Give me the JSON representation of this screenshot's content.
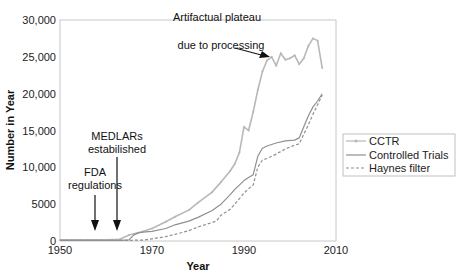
{
  "chart_data": {
    "type": "line",
    "title": "",
    "xlabel": "Year",
    "ylabel": "Number in Year",
    "xlim": [
      1950,
      2010
    ],
    "ylim": [
      0,
      30000
    ],
    "x_ticks": [
      1950,
      1970,
      1990,
      2010
    ],
    "x_tick_labels": [
      "1950",
      "1970",
      "1990",
      "2010"
    ],
    "y_ticks": [
      0,
      5000,
      10000,
      15000,
      20000,
      25000,
      30000
    ],
    "y_tick_labels": [
      "0",
      "5000",
      "10,000",
      "15,000",
      "20,000",
      "25,000",
      "30,000"
    ],
    "grid": false,
    "legend_position": "right",
    "series": [
      {
        "name": "CCTR",
        "style": "solid-marker",
        "color": "#b8b8b8",
        "x": [
          1950,
          1955,
          1960,
          1963,
          1965,
          1968,
          1970,
          1973,
          1975,
          1978,
          1980,
          1983,
          1985,
          1987,
          1988,
          1989,
          1990,
          1991,
          1992,
          1993,
          1994,
          1995,
          1996,
          1997,
          1998,
          1999,
          2000,
          2001,
          2002,
          2003,
          2004,
          2005,
          2006,
          2007
        ],
        "y": [
          150,
          150,
          150,
          250,
          800,
          1300,
          1700,
          2600,
          3300,
          4200,
          5200,
          6600,
          8000,
          9500,
          10500,
          12000,
          15500,
          15000,
          17500,
          20500,
          23000,
          24500,
          25000,
          23800,
          25500,
          24600,
          24800,
          25200,
          24000,
          24800,
          26500,
          27500,
          27200,
          23500
        ]
      },
      {
        "name": "Controlled Trials",
        "style": "solid",
        "color": "#909090",
        "x": [
          1950,
          1955,
          1960,
          1963,
          1965,
          1966,
          1967,
          1968,
          1970,
          1973,
          1975,
          1978,
          1980,
          1983,
          1985,
          1987,
          1988,
          1990,
          1991,
          1992,
          1993,
          1994,
          1995,
          1997,
          1999,
          2001,
          2002,
          2003,
          2004,
          2005,
          2006,
          2007
        ],
        "y": [
          100,
          100,
          100,
          100,
          150,
          800,
          1100,
          1200,
          1300,
          1700,
          2200,
          2700,
          3200,
          4100,
          5000,
          6300,
          7000,
          8200,
          8600,
          9000,
          11500,
          12600,
          12900,
          13300,
          13600,
          13700,
          14000,
          15500,
          17000,
          18200,
          19000,
          20000
        ]
      },
      {
        "name": "Haynes filter",
        "style": "dashed",
        "color": "#909090",
        "x": [
          1950,
          1955,
          1960,
          1965,
          1968,
          1970,
          1973,
          1975,
          1978,
          1980,
          1983,
          1984,
          1985,
          1987,
          1988,
          1990,
          1991,
          1992,
          1993,
          1994,
          1995,
          1997,
          1999,
          2001,
          2002,
          2003,
          2004,
          2005,
          2006,
          2007
        ],
        "y": [
          100,
          100,
          100,
          100,
          120,
          300,
          600,
          900,
          1400,
          1900,
          2500,
          2700,
          3500,
          4300,
          5000,
          6500,
          7100,
          7600,
          10000,
          11000,
          11200,
          11800,
          12500,
          13000,
          13200,
          14500,
          15800,
          17200,
          18500,
          19800
        ]
      }
    ],
    "annotations": [
      {
        "id": "plateau",
        "lines": [
          "Artifactual plateau",
          "due to processing"
        ],
        "target_x": 1996,
        "target_y": 24500
      },
      {
        "id": "medlars",
        "lines": [
          "MEDLARs",
          "estabilished"
        ],
        "target_x": 1964,
        "target_y": 0
      },
      {
        "id": "fda",
        "lines": [
          "FDA",
          "regulations"
        ],
        "target_x": 1960,
        "target_y": 0
      }
    ]
  }
}
